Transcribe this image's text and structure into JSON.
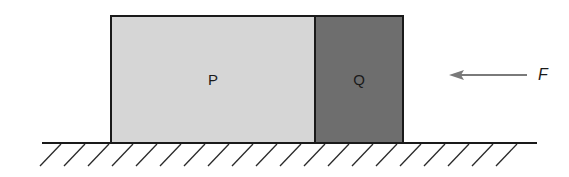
{
  "diagram": {
    "blocks": [
      {
        "id": "P",
        "label": "P",
        "color": "#d6d6d6",
        "x": 110,
        "y": 15,
        "w": 206,
        "h": 129
      },
      {
        "id": "Q",
        "label": "Q",
        "color": "#6e6e6e",
        "x": 314,
        "y": 15,
        "w": 90,
        "h": 129
      }
    ],
    "force": {
      "label": "F",
      "direction": "left",
      "color": "#7a7a7a"
    },
    "ground": {
      "type": "hatched-surface",
      "color": "#1a1a1a"
    }
  }
}
